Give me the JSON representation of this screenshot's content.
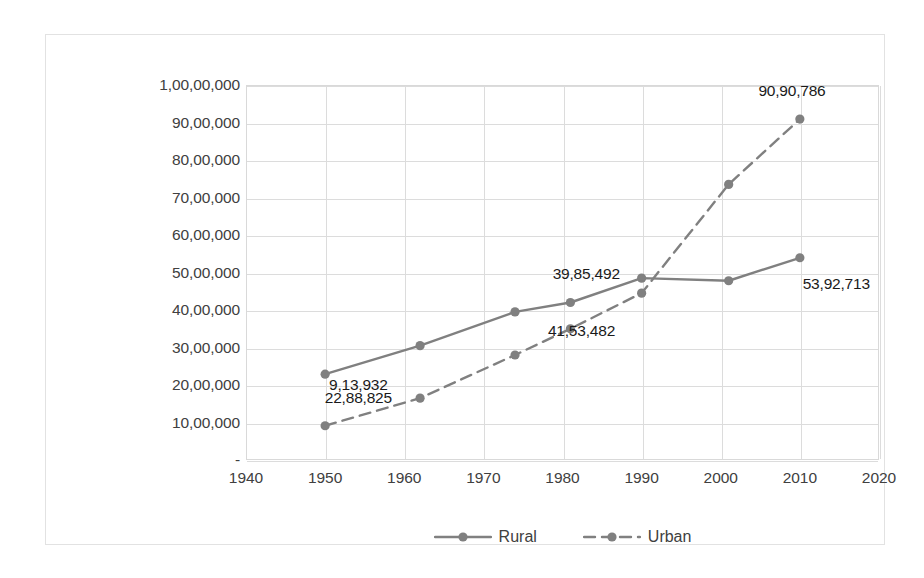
{
  "chart_data": {
    "type": "line",
    "title": "",
    "xlabel": "",
    "ylabel": "",
    "xlim": [
      1940,
      2020
    ],
    "ylim": [
      0,
      10000000
    ],
    "grid": true,
    "legend_position": "bottom",
    "x_ticks": [
      "1940",
      "1950",
      "1960",
      "1970",
      "1980",
      "1990",
      "2000",
      "2010",
      "2020"
    ],
    "x_tick_values": [
      1940,
      1950,
      1960,
      1970,
      1980,
      1990,
      2000,
      2010,
      2020
    ],
    "y_ticks": [
      "-",
      "10,00,000",
      "20,00,000",
      "30,00,000",
      "40,00,000",
      "50,00,000",
      "60,00,000",
      "70,00,000",
      "80,00,000",
      "90,00,000",
      "1,00,00,000"
    ],
    "y_tick_values": [
      0,
      1000000,
      2000000,
      3000000,
      4000000,
      5000000,
      6000000,
      7000000,
      8000000,
      9000000,
      10000000
    ],
    "series": [
      {
        "name": "Rural",
        "style": "solid",
        "color": "#808080",
        "x": [
          1950,
          1962,
          1974,
          1981,
          1990,
          2001,
          2010
        ],
        "values": [
          2288825,
          3050000,
          3950000,
          4200000,
          4850000,
          4780000,
          5392713
        ]
      },
      {
        "name": "Urban",
        "style": "dashed",
        "color": "#808080",
        "x": [
          1950,
          1962,
          1974,
          1981,
          1990,
          2001,
          2010
        ],
        "values": [
          913932,
          1650000,
          2800000,
          3500000,
          4450000,
          7350000,
          9090786
        ]
      }
    ],
    "annotations": [
      {
        "text": "9,13,932",
        "x": 1954.2,
        "y": 2000000
      },
      {
        "text": "22,88,825",
        "x": 1954.2,
        "y": 1650000
      },
      {
        "text": "39,85,492",
        "x": 1983.0,
        "y": 4950000
      },
      {
        "text": "41,53,482",
        "x": 1982.4,
        "y": 3450000
      },
      {
        "text": "90,90,786",
        "x": 2009.0,
        "y": 9850000
      },
      {
        "text": "53,92,713",
        "x": 2014.6,
        "y": 4700000
      }
    ]
  },
  "legend": {
    "items": [
      {
        "label": "Rural",
        "style": "solid"
      },
      {
        "label": "Urban",
        "style": "dashed"
      }
    ]
  },
  "colors": {
    "series": "#808080",
    "grid": "#dcdcdc",
    "frame": "#e2e2e2",
    "text": "#404040",
    "label_text": "#1a1a1a"
  }
}
